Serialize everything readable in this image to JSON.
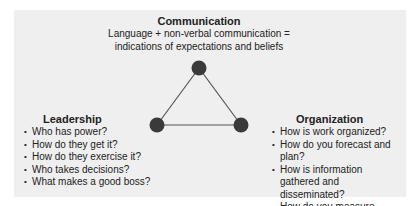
{
  "communication": {
    "title": "Communication",
    "line1": "Language + non-verbal communication =",
    "line2": "indications of expectations and beliefs"
  },
  "leadership": {
    "title": "Leadership",
    "items": [
      "Who has power?",
      "How do they get it?",
      "How do they exercise it?",
      "Who takes decisions?",
      "What makes a good boss?"
    ]
  },
  "organization": {
    "title": "Organization",
    "items": [
      "How is work organized?",
      "How do you forecast and plan?",
      "How is information gathered and disseminated?",
      "How do you measure results?"
    ]
  },
  "colors": {
    "panel": "#efefef",
    "node": "#3a3a3a",
    "edge": "#555555"
  }
}
